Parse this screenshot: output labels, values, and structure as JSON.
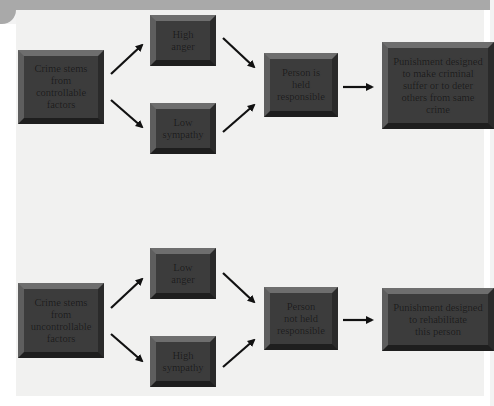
{
  "diagram": {
    "top_flow": {
      "cause": "Crime stems\nfrom\ncontrollable\nfactors",
      "emotion_1": "High\nanger",
      "emotion_2": "Low\nsympathy",
      "judgment": "Person is\nheld\nresponsible",
      "outcome": "Punishment designed\nto make criminal\nsuffer or to deter\nothers from same\ncrime"
    },
    "bottom_flow": {
      "cause": "Crime stems\nfrom\nuncontrollable\nfactors",
      "emotion_1": "Low\nanger",
      "emotion_2": "High\nsympathy",
      "judgment": "Person\nnot held\nresponsible",
      "outcome": "Punishment designed\nto rehabilitate\nthis person"
    },
    "colors": {
      "box_fill": "#3c3c3c",
      "background": "#f1f1f0",
      "arrow": "#111111"
    }
  }
}
